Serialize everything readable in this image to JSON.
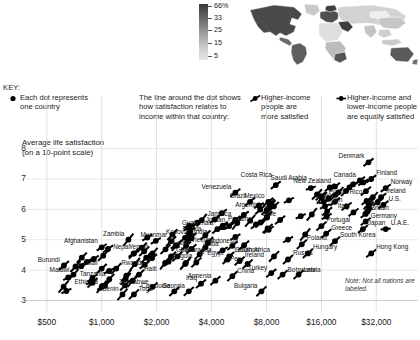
{
  "figure": {
    "note": "Note: Not all nations are labeled.",
    "y_axis_title_line1": "Average life satisfaction",
    "y_axis_title_line2": "(on a 10-point scale)"
  },
  "map": {
    "name": "world-choropleth",
    "scale_ticks": [
      "66%",
      "33",
      "25",
      "15",
      "5"
    ]
  },
  "key": {
    "title": "KEY:",
    "items": [
      {
        "icon": "dot-icon",
        "lines": [
          "Each dot represents",
          "one country"
        ]
      },
      {
        "icon": "none",
        "lines": [
          "The line around the dot shows",
          "how satisfaction relates to",
          "income within that country:"
        ]
      },
      {
        "icon": "steep-slope-icon",
        "lines": [
          "Higher-income",
          "people are",
          "more satisfied"
        ]
      },
      {
        "icon": "flat-slope-icon",
        "lines": [
          "Higher-income and",
          "lower-income people",
          "are equally satisfied"
        ]
      }
    ]
  },
  "chart_data": {
    "type": "scatter",
    "title": "",
    "xlabel": "",
    "ylabel": "Average life satisfaction (on a 10-point scale)",
    "xscale": "log",
    "x_ticks": [
      "$500",
      "$1,000",
      "$2,000",
      "$4,000",
      "$8,000",
      "$16,000",
      "$32,000"
    ],
    "x_tick_values": [
      500,
      1000,
      2000,
      4000,
      8000,
      16000,
      32000
    ],
    "y_ticks": [
      "3",
      "4",
      "5",
      "6",
      "7",
      "8"
    ],
    "y_tick_values": [
      3,
      4,
      5,
      6,
      7,
      8
    ],
    "xlim": [
      420,
      40000
    ],
    "ylim": [
      2.85,
      8.35
    ],
    "grid": true,
    "legend": "none",
    "points": [
      {
        "name": "Afghanistan",
        "x": 1000,
        "y": 4.75,
        "slope": 0.3,
        "lx": -4,
        "ly": -4,
        "anchor": "r"
      },
      {
        "name": "Burundi",
        "x": 620,
        "y": 4.15,
        "slope": 0.42,
        "lx": -4,
        "ly": -4,
        "anchor": "r"
      },
      {
        "name": "Zambia",
        "x": 1400,
        "y": 5.0,
        "slope": 0.55,
        "lx": -4,
        "ly": -4,
        "anchor": "r"
      },
      {
        "name": "Yemen",
        "x": 1900,
        "y": 4.55,
        "slope": 0.5,
        "lx": -4,
        "ly": -4,
        "anchor": "r"
      },
      {
        "name": "Malawi",
        "x": 700,
        "y": 3.85,
        "slope": 0.5,
        "lx": -4,
        "ly": -3,
        "anchor": "r"
      },
      {
        "name": "Tanzania",
        "x": 1100,
        "y": 3.7,
        "slope": 0.48,
        "lx": -4,
        "ly": -3,
        "anchor": "r"
      },
      {
        "name": "Mali",
        "x": 1000,
        "y": 4.05,
        "slope": 0.42,
        "lx": -4,
        "ly": -4,
        "anchor": "r"
      },
      {
        "name": "Ethiopia",
        "x": 1000,
        "y": 3.45,
        "slope": 0.55,
        "lx": -4,
        "ly": -3,
        "anchor": "r"
      },
      {
        "name": "Benin",
        "x": 1300,
        "y": 3.2,
        "slope": 0.52,
        "lx": -4,
        "ly": -3,
        "anchor": "r"
      },
      {
        "name": "Rwanda",
        "x": 1200,
        "y": 4.05,
        "slope": 0.5,
        "lx": 5,
        "ly": -4,
        "anchor": "l"
      },
      {
        "name": "Kosovo",
        "x": 3100,
        "y": 5.05,
        "slope": 0.48,
        "lx": -4,
        "ly": -4,
        "anchor": "r"
      },
      {
        "name": "Nepal",
        "x": 1500,
        "y": 4.55,
        "slope": 0.48,
        "lx": -4,
        "ly": -4,
        "anchor": "r"
      },
      {
        "name": "Myanmar",
        "x": 2400,
        "y": 4.95,
        "slope": 0.45,
        "lx": -4,
        "ly": -4,
        "anchor": "r"
      },
      {
        "name": "Laos",
        "x": 3100,
        "y": 4.7,
        "slope": 0.42,
        "lx": -4,
        "ly": -4,
        "anchor": "r"
      },
      {
        "name": "Haiti",
        "x": 1600,
        "y": 3.85,
        "slope": 0.45,
        "lx": 5,
        "ly": -4,
        "anchor": "l"
      },
      {
        "name": "Togo",
        "x": 1500,
        "y": 3.2,
        "slope": 0.45,
        "lx": 5,
        "ly": -3,
        "anchor": "l"
      },
      {
        "name": "Zimbabwe",
        "x": 1900,
        "y": 3.45,
        "slope": 0.4,
        "lx": -4,
        "ly": -3,
        "anchor": "r"
      },
      {
        "name": "Cambodia",
        "x": 2500,
        "y": 3.3,
        "slope": 0.42,
        "lx": -4,
        "ly": -3,
        "anchor": "r"
      },
      {
        "name": "Iraq",
        "x": 3500,
        "y": 3.55,
        "slope": 0.38,
        "lx": -4,
        "ly": -4,
        "anchor": "r"
      },
      {
        "name": "Georgia",
        "x": 3000,
        "y": 3.3,
        "slope": 0.4,
        "lx": -4,
        "ly": -3,
        "anchor": "r"
      },
      {
        "name": "Armenia",
        "x": 4200,
        "y": 3.65,
        "slope": 0.4,
        "lx": -4,
        "ly": -3,
        "anchor": "r"
      },
      {
        "name": "Bulgaria",
        "x": 7500,
        "y": 3.3,
        "slope": 0.45,
        "lx": -4,
        "ly": -3,
        "anchor": "r"
      },
      {
        "name": "Ghana",
        "x": 2400,
        "y": 4.45,
        "slope": 0.42,
        "lx": 5,
        "ly": -4,
        "anchor": "l"
      },
      {
        "name": "Angola",
        "x": 3300,
        "y": 4.25,
        "slope": 0.45,
        "lx": -4,
        "ly": -4,
        "anchor": "r"
      },
      {
        "name": "Vietnam",
        "x": 2900,
        "y": 4.8,
        "slope": 0.4,
        "lx": 5,
        "ly": -4,
        "anchor": "l"
      },
      {
        "name": "Bolivia",
        "x": 3700,
        "y": 5.15,
        "slope": 0.42,
        "lx": -4,
        "ly": -4,
        "anchor": "r"
      },
      {
        "name": "India",
        "x": 3000,
        "y": 5.05,
        "slope": 0.45,
        "lx": 5,
        "ly": -4,
        "anchor": "l"
      },
      {
        "name": "Cuba",
        "x": 4600,
        "y": 4.65,
        "slope": 0.3,
        "lx": -4,
        "ly": -4,
        "anchor": "r"
      },
      {
        "name": "Indonesia",
        "x": 3700,
        "y": 4.75,
        "slope": 0.4,
        "lx": 5,
        "ly": -4,
        "anchor": "l"
      },
      {
        "name": "Nicaragua",
        "x": 2600,
        "y": 4.45,
        "slope": 0.45,
        "lx": 5,
        "ly": -4,
        "anchor": "l"
      },
      {
        "name": "Guatemala",
        "x": 4300,
        "y": 5.35,
        "slope": 0.4,
        "lx": -4,
        "ly": -4,
        "anchor": "r"
      },
      {
        "name": "Jamaica",
        "x": 5400,
        "y": 5.65,
        "slope": 0.35,
        "lx": -4,
        "ly": -4,
        "anchor": "r"
      },
      {
        "name": "Jordan",
        "x": 5000,
        "y": 5.45,
        "slope": 0.3,
        "lx": -4,
        "ly": -4,
        "anchor": "r"
      },
      {
        "name": "Lebanon",
        "x": 5000,
        "y": 4.45,
        "slope": 0.4,
        "lx": 5,
        "ly": -4,
        "anchor": "l"
      },
      {
        "name": "Egypt",
        "x": 4900,
        "y": 4.35,
        "slope": 0.42,
        "lx": -4,
        "ly": -4,
        "anchor": "r"
      },
      {
        "name": "Ireland",
        "x": 5700,
        "y": 4.3,
        "slope": 0.38,
        "lx": 5,
        "ly": -4,
        "anchor": "l"
      },
      {
        "name": "Peru",
        "x": 6300,
        "y": 4.2,
        "slope": 0.42,
        "lx": -4,
        "ly": -3,
        "anchor": "r"
      },
      {
        "name": "China",
        "x": 5200,
        "y": 3.8,
        "slope": 0.45,
        "lx": 5,
        "ly": -3,
        "anchor": "l"
      },
      {
        "name": "Turkey",
        "x": 8500,
        "y": 3.9,
        "slope": 0.38,
        "lx": -4,
        "ly": -3,
        "anchor": "r"
      },
      {
        "name": "Botswana",
        "x": 9800,
        "y": 3.85,
        "slope": 0.4,
        "lx": 5,
        "ly": -3,
        "anchor": "l"
      },
      {
        "name": "Latvia",
        "x": 12000,
        "y": 3.85,
        "slope": 0.4,
        "lx": 5,
        "ly": -3,
        "anchor": "l"
      },
      {
        "name": "Russia",
        "x": 10500,
        "y": 4.35,
        "slope": 0.4,
        "lx": 5,
        "ly": -4,
        "anchor": "l"
      },
      {
        "name": "Hungary",
        "x": 13500,
        "y": 4.55,
        "slope": 0.42,
        "lx": 5,
        "ly": -4,
        "anchor": "l"
      },
      {
        "name": "Poland",
        "x": 12500,
        "y": 4.85,
        "slope": 0.42,
        "lx": 5,
        "ly": -4,
        "anchor": "l"
      },
      {
        "name": "South Africa",
        "x": 8800,
        "y": 4.45,
        "slope": 0.48,
        "lx": -4,
        "ly": -4,
        "anchor": "r"
      },
      {
        "name": "Hong Kong",
        "x": 30000,
        "y": 4.55,
        "slope": 0.35,
        "lx": 5,
        "ly": -4,
        "anchor": "l"
      },
      {
        "name": "South Korea",
        "x": 19000,
        "y": 4.95,
        "slope": 0.4,
        "lx": 5,
        "ly": -4,
        "anchor": "l"
      },
      {
        "name": "Greece",
        "x": 17000,
        "y": 5.2,
        "slope": 0.4,
        "lx": 5,
        "ly": -4,
        "anchor": "l"
      },
      {
        "name": "Portugal",
        "x": 16000,
        "y": 5.45,
        "slope": 0.4,
        "lx": 5,
        "ly": -4,
        "anchor": "l"
      },
      {
        "name": "Chile",
        "x": 9500,
        "y": 5.65,
        "slope": 0.38,
        "lx": -4,
        "ly": -4,
        "anchor": "r"
      },
      {
        "name": "Argentina",
        "x": 8000,
        "y": 5.95,
        "slope": 0.35,
        "lx": -4,
        "ly": -4,
        "anchor": "r"
      },
      {
        "name": "Brazil",
        "x": 6500,
        "y": 6.25,
        "slope": 0.38,
        "lx": -4,
        "ly": -4,
        "anchor": "r"
      },
      {
        "name": "Mexico",
        "x": 8200,
        "y": 6.25,
        "slope": 0.35,
        "lx": -4,
        "ly": -4,
        "anchor": "r"
      },
      {
        "name": "Panama",
        "x": 7000,
        "y": 5.5,
        "slope": 0.38,
        "lx": -4,
        "ly": -4,
        "anchor": "r"
      },
      {
        "name": "Venezuela",
        "x": 5400,
        "y": 6.55,
        "slope": 0.35,
        "lx": -4,
        "ly": -4,
        "anchor": "r"
      },
      {
        "name": "Costa Rica",
        "x": 9000,
        "y": 6.8,
        "slope": 0.35,
        "lx": -4,
        "ly": -8,
        "anchor": "r"
      },
      {
        "name": "Saudi Arabia",
        "x": 14000,
        "y": 6.7,
        "slope": 0.15,
        "lx": -4,
        "ly": -8,
        "anchor": "r"
      },
      {
        "name": "Puerto Rico",
        "x": 16500,
        "y": 6.25,
        "slope": 0.15,
        "lx": 5,
        "ly": -8,
        "anchor": "l"
      },
      {
        "name": "New Zealand",
        "x": 19000,
        "y": 6.75,
        "slope": 0.35,
        "lx": -4,
        "ly": -4,
        "anchor": "r"
      },
      {
        "name": "Israel",
        "x": 19000,
        "y": 6.25,
        "slope": 0.35,
        "lx": -4,
        "ly": -4,
        "anchor": "r"
      },
      {
        "name": "Spain",
        "x": 22000,
        "y": 6.1,
        "slope": 0.35,
        "lx": -4,
        "ly": -4,
        "anchor": "r"
      },
      {
        "name": "Italy",
        "x": 24000,
        "y": 5.9,
        "slope": 0.35,
        "lx": -4,
        "ly": -4,
        "anchor": "r"
      },
      {
        "name": "Canada",
        "x": 26000,
        "y": 6.95,
        "slope": 0.35,
        "lx": -4,
        "ly": -4,
        "anchor": "r"
      },
      {
        "name": "Denmark",
        "x": 29000,
        "y": 7.55,
        "slope": 0.35,
        "lx": -4,
        "ly": -4,
        "anchor": "r"
      },
      {
        "name": "Finland",
        "x": 30000,
        "y": 7.0,
        "slope": 0.35,
        "lx": 5,
        "ly": -4,
        "anchor": "l"
      },
      {
        "name": "Norway",
        "x": 36000,
        "y": 6.7,
        "slope": 0.35,
        "lx": 5,
        "ly": -4,
        "anchor": "l"
      },
      {
        "name": "Ireland2",
        "x": 34000,
        "y": 6.4,
        "slope": 0.35,
        "lx": 5,
        "ly": -4,
        "anchor": "l",
        "display": "Ireland"
      },
      {
        "name": "U.S.",
        "x": 35000,
        "y": 6.15,
        "slope": 0.35,
        "lx": 5,
        "ly": -4,
        "anchor": "l"
      },
      {
        "name": "Britain",
        "x": 28000,
        "y": 5.85,
        "slope": 0.35,
        "lx": 5,
        "ly": -4,
        "anchor": "l"
      },
      {
        "name": "Germany",
        "x": 28000,
        "y": 5.6,
        "slope": 0.35,
        "lx": 5,
        "ly": -4,
        "anchor": "l"
      },
      {
        "name": "Japan",
        "x": 27000,
        "y": 5.35,
        "slope": 0.35,
        "lx": 5,
        "ly": -4,
        "anchor": "l"
      },
      {
        "name": "U.A.E.",
        "x": 36000,
        "y": 5.35,
        "slope": 0.05,
        "lx": 5,
        "ly": -4,
        "anchor": "l"
      }
    ]
  }
}
